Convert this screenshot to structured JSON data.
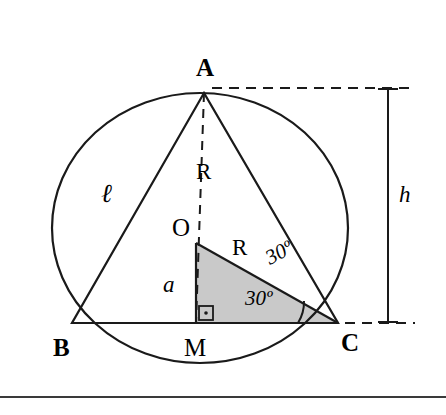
{
  "figure": {
    "vertices": [
      {
        "id": "A",
        "label": "A",
        "x": 205,
        "y": 68
      },
      {
        "id": "B",
        "label": "B",
        "x": 62,
        "y": 348
      },
      {
        "id": "C",
        "label": "C",
        "x": 350,
        "y": 343
      },
      {
        "id": "O",
        "label": "O",
        "x": 180,
        "y": 228
      },
      {
        "id": "M",
        "label": "M",
        "x": 194,
        "y": 348
      }
    ],
    "segments": [
      {
        "id": "l",
        "label": "ℓ",
        "x": 105,
        "y": 192
      },
      {
        "id": "R-upper",
        "label": "R",
        "x": 203,
        "y": 172
      },
      {
        "id": "R-lower",
        "label": "R",
        "x": 239,
        "y": 248
      },
      {
        "id": "a",
        "label": "a",
        "x": 168,
        "y": 285
      },
      {
        "id": "h",
        "label": "h",
        "x": 404,
        "y": 195
      }
    ],
    "angles": [
      {
        "id": "angle-upper",
        "label": "30º",
        "x": 271,
        "y": 262,
        "rotate": -28
      },
      {
        "id": "angle-lower",
        "label": "30º",
        "x": 252,
        "y": 298,
        "rotate": 0
      }
    ],
    "markers": [
      {
        "id": "right-angle-mark",
        "label": "right-angle-square"
      }
    ],
    "colors": {
      "stroke": "#1a1a1a",
      "shaded_fill": "#c9c9c9",
      "rule": "#3a3a3a",
      "background": "#ffffff"
    }
  }
}
